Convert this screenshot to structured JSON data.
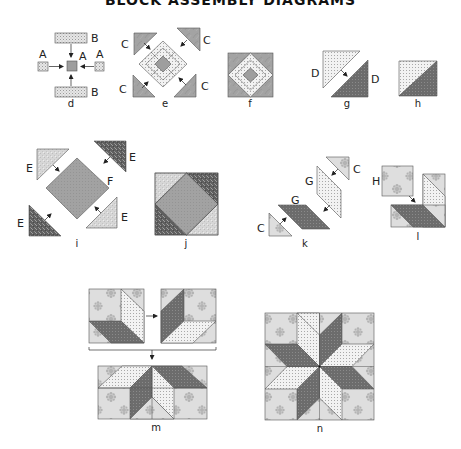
{
  "title": "BLOCK ASSEMBLY DIAGRAMS",
  "colors": {
    "outline": "#555555",
    "light_dot": "#efefef",
    "dot": "#b5b5b5",
    "medium": "#a9a9a9",
    "dark": "#6e6e6e",
    "floral_bg": "#dcdcdc",
    "floral_flower": "#b0b0b0"
  },
  "diagrams": {
    "d": {
      "caption": "d",
      "labels": {
        "b_top": "B",
        "a_left": "A",
        "a_center": "A",
        "a_right": "A",
        "b_bottom": "B"
      }
    },
    "e": {
      "caption": "e",
      "labels": {
        "c_tl": "C",
        "c_tr": "C",
        "c_bl": "C",
        "c_br": "C"
      }
    },
    "f": {
      "caption": "f"
    },
    "g": {
      "caption": "g",
      "labels": {
        "d_top": "D",
        "d_bottom": "D"
      }
    },
    "h": {
      "caption": "h"
    },
    "i": {
      "caption": "i",
      "labels": {
        "e_tl": "E",
        "e_tr": "E",
        "f_center": "F",
        "e_bl": "E",
        "e_br": "E"
      }
    },
    "j": {
      "caption": "j"
    },
    "k": {
      "caption": "k",
      "labels": {
        "c_top": "C",
        "g_upper": "G",
        "g_lower": "G",
        "c_bottom": "C"
      }
    },
    "l": {
      "caption": "l",
      "labels": {
        "h": "H"
      }
    },
    "m": {
      "caption": "m"
    },
    "n": {
      "caption": "n"
    }
  }
}
